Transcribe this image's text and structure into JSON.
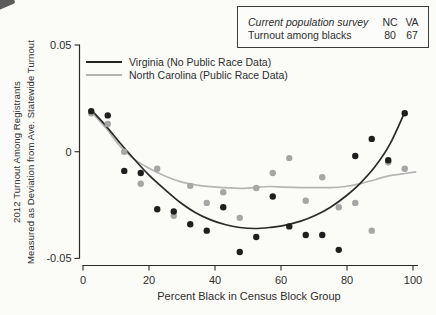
{
  "figure": {
    "background": "#fbfbf8",
    "text_color": "#2e2e2e",
    "axis_color": "#2b2b2b"
  },
  "info_box": {
    "header_row": {
      "label": "Current population survey",
      "nc": "NC",
      "va": "VA"
    },
    "value_row": {
      "label": "Turnout among blacks",
      "nc": "80",
      "va": "67"
    }
  },
  "legend": {
    "items": [
      {
        "label": "Virginia (No Public Race Data)",
        "color": "#232323"
      },
      {
        "label": "North Carolina (Public Race Data)",
        "color": "#b2b2b2"
      }
    ]
  },
  "chart_data": {
    "type": "scatter",
    "title": "",
    "xlabel": "Percent Black in Census Block Group",
    "ylabel_line1": "2012 Turnout Among Registrants",
    "ylabel_line2": "Measured as Deviation from Ave. Statewide Turnout",
    "xlim": [
      0,
      100
    ],
    "ylim": [
      -0.05,
      0.05
    ],
    "grid": false,
    "legend_position": "upper-left-inside",
    "x_ticks": [
      {
        "v": 0,
        "label": "0"
      },
      {
        "v": 20,
        "label": "20"
      },
      {
        "v": 40,
        "label": "40"
      },
      {
        "v": 60,
        "label": "60"
      },
      {
        "v": 80,
        "label": "80"
      },
      {
        "v": 100,
        "label": "100"
      }
    ],
    "y_ticks": [
      {
        "v": 0.05,
        "label": "0.05"
      },
      {
        "v": 0,
        "label": "0"
      },
      {
        "v": -0.05,
        "label": "-0.05"
      }
    ],
    "x_bins": [
      2.5,
      7.5,
      12.5,
      17.5,
      22.5,
      27.5,
      32.5,
      37.5,
      42.5,
      47.5,
      52.5,
      57.5,
      62.5,
      67.5,
      72.5,
      77.5,
      82.5,
      87.5,
      92.5,
      97.5
    ],
    "series": [
      {
        "name": "Virginia (No Public Race Data)",
        "state": "VA",
        "point_color": "#1f1f1f",
        "line_color": "#2a2a2a",
        "y": [
          0.019,
          0.017,
          -0.009,
          -0.01,
          -0.027,
          -0.028,
          -0.034,
          -0.037,
          -0.026,
          -0.047,
          -0.04,
          -0.021,
          -0.035,
          -0.039,
          -0.039,
          -0.046,
          -0.002,
          0.006,
          -0.004,
          0.018
        ],
        "fit": {
          "x": [
            2.5,
            7,
            11,
            15.5,
            20,
            25,
            29.5,
            34,
            38.5,
            43,
            47.5,
            52,
            56.5,
            61,
            66,
            70.5,
            75,
            79.5,
            84,
            88.5,
            93,
            97.3
          ],
          "y": [
            0.0196,
            0.012,
            0.0045,
            -0.0035,
            -0.011,
            -0.018,
            -0.0238,
            -0.0285,
            -0.0318,
            -0.0341,
            -0.0355,
            -0.036,
            -0.0355,
            -0.0345,
            -0.0325,
            -0.0298,
            -0.026,
            -0.021,
            -0.0148,
            -0.007,
            0.0035,
            0.0178
          ]
        }
      },
      {
        "name": "North Carolina (Public Race Data)",
        "state": "NC",
        "point_color": "#a6a6a6",
        "line_color": "#b5b5b5",
        "y": [
          0.018,
          0.013,
          0.0,
          -0.015,
          -0.008,
          -0.03,
          -0.016,
          -0.024,
          -0.019,
          -0.031,
          -0.017,
          -0.01,
          -0.003,
          -0.023,
          -0.012,
          -0.026,
          -0.024,
          -0.037,
          -0.005,
          -0.008
        ],
        "fit": {
          "x": [
            2.5,
            7,
            11,
            15.5,
            20,
            25,
            29.5,
            34,
            38.5,
            43,
            47.5,
            52,
            56.5,
            61,
            66,
            70.5,
            75,
            79.5,
            84,
            88.5,
            93,
            97.5,
            100.8
          ],
          "y": [
            0.0187,
            0.011,
            0.003,
            -0.0035,
            -0.0078,
            -0.0115,
            -0.014,
            -0.0155,
            -0.0164,
            -0.0168,
            -0.0172,
            -0.0168,
            -0.0163,
            -0.0166,
            -0.0168,
            -0.0168,
            -0.0168,
            -0.0163,
            -0.015,
            -0.0131,
            -0.0112,
            -0.0102,
            -0.0094
          ]
        }
      }
    ]
  }
}
